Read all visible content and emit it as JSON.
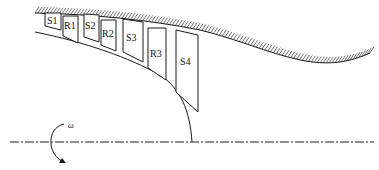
{
  "diagram": {
    "blades": [
      {
        "id": "S1",
        "label": "S1",
        "type": "stator"
      },
      {
        "id": "R1",
        "label": "R1",
        "type": "rotor"
      },
      {
        "id": "S2",
        "label": "S2",
        "type": "stator"
      },
      {
        "id": "R2",
        "label": "R2",
        "type": "rotor"
      },
      {
        "id": "S3",
        "label": "S3",
        "type": "stator"
      },
      {
        "id": "R3",
        "label": "R3",
        "type": "rotor"
      },
      {
        "id": "S4",
        "label": "S4",
        "type": "stator"
      }
    ],
    "rotation_label": "ω",
    "components": {
      "shroud": "casing-wall-hatched",
      "hub": "hub-curve",
      "axis": "rotation-axis-centerline"
    }
  }
}
